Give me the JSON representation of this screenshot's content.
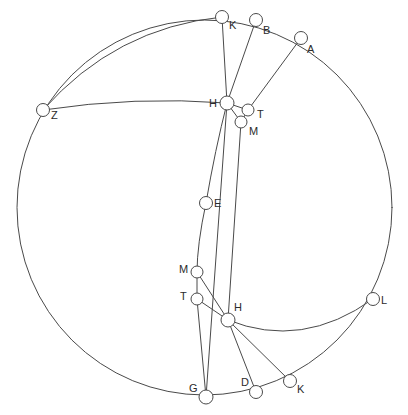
{
  "figure": {
    "background_color": "#ffffff",
    "stroke_color": "#4a4a4a",
    "label_color": "#2b2b2b",
    "width": 408,
    "height": 415
  },
  "outer_circle": {
    "name": "main-circle",
    "cx": 204.5,
    "cy": 207.5,
    "r": 187.5
  },
  "points": [
    {
      "id": "K_top",
      "label": "K",
      "x": 222,
      "y": 17,
      "r": 6.5,
      "label_dx": 7,
      "label_dy": 9
    },
    {
      "id": "B_top",
      "label": "B",
      "x": 256,
      "y": 20,
      "r": 6.5,
      "label_dx": 7,
      "label_dy": 11
    },
    {
      "id": "A_top",
      "label": "A",
      "x": 301,
      "y": 38,
      "r": 6.5,
      "label_dx": 6,
      "label_dy": 12
    },
    {
      "id": "Z_left",
      "label": "Z",
      "x": 43,
      "y": 110,
      "r": 6.5,
      "label_dx": 8,
      "label_dy": 6
    },
    {
      "id": "H_upper",
      "label": "H",
      "x": 227,
      "y": 103,
      "r": 7.0,
      "label_dx": -18,
      "label_dy": 1
    },
    {
      "id": "T_upper",
      "label": "T",
      "x": 248,
      "y": 110,
      "r": 6.0,
      "label_dx": 9,
      "label_dy": 5
    },
    {
      "id": "M_upper",
      "label": "M",
      "x": 241,
      "y": 122,
      "r": 6.0,
      "label_dx": 8,
      "label_dy": 10
    },
    {
      "id": "E_mid",
      "label": "E",
      "x": 206,
      "y": 203,
      "r": 6.5,
      "label_dx": 8,
      "label_dy": 1
    },
    {
      "id": "M_lower",
      "label": "M",
      "x": 197,
      "y": 272,
      "r": 6.0,
      "label_dx": -18,
      "label_dy": -2
    },
    {
      "id": "T_lower",
      "label": "T",
      "x": 197,
      "y": 299,
      "r": 6.0,
      "label_dx": -17,
      "label_dy": -2
    },
    {
      "id": "H_lower",
      "label": "H",
      "x": 228,
      "y": 320,
      "r": 7.0,
      "label_dx": 6,
      "label_dy": -12
    },
    {
      "id": "L_right",
      "label": "L",
      "x": 373,
      "y": 299,
      "r": 6.5,
      "label_dx": 8,
      "label_dy": 2
    },
    {
      "id": "G_bottom",
      "label": "G",
      "x": 206,
      "y": 397,
      "r": 7.0,
      "label_dx": -17,
      "label_dy": -8
    },
    {
      "id": "D_bottom",
      "label": "D",
      "x": 256,
      "y": 392,
      "r": 6.5,
      "label_dx": -15,
      "label_dy": -9
    },
    {
      "id": "K_bottom",
      "label": "K",
      "x": 290,
      "y": 381,
      "r": 6.5,
      "label_dx": 7,
      "label_dy": 9
    }
  ],
  "segments": [
    {
      "name": "segment-K-H-upper",
      "from": "K_top",
      "to": "H_upper"
    },
    {
      "name": "segment-B-H-upper",
      "from": "B_top",
      "to": "H_upper"
    },
    {
      "name": "segment-A-T-upper",
      "from": "A_top",
      "to": "T_upper"
    },
    {
      "name": "segment-H-T-upper",
      "from": "H_upper",
      "to": "T_upper"
    },
    {
      "name": "segment-H-M-upper",
      "from": "H_upper",
      "to": "M_upper"
    },
    {
      "name": "segment-T-M-upper",
      "from": "T_upper",
      "to": "M_upper"
    },
    {
      "name": "segment-M-upper-H-lower",
      "from": "M_upper",
      "to": "H_lower"
    },
    {
      "name": "segment-H-upper-G",
      "from": "H_upper",
      "to": "G_bottom"
    },
    {
      "name": "segment-M-T-lower",
      "from": "M_lower",
      "to": "T_lower"
    },
    {
      "name": "segment-T-lower-G",
      "from": "T_lower",
      "to": "G_bottom"
    },
    {
      "name": "segment-T-lower-H-lower",
      "from": "T_lower",
      "to": "H_lower"
    },
    {
      "name": "segment-H-lower-D",
      "from": "H_lower",
      "to": "D_bottom"
    },
    {
      "name": "segment-H-lower-K-bottom",
      "from": "H_lower",
      "to": "K_bottom"
    },
    {
      "name": "segment-M-lower-H-lower",
      "from": "M_lower",
      "to": "H_lower"
    }
  ],
  "arcs": [
    {
      "name": "arc-Z-to-H-upper",
      "d": "M 43 110 Q 135 96 227 103"
    },
    {
      "name": "arc-Z-to-K-top",
      "d": "M 43 110 Q 115 28 222 17"
    },
    {
      "name": "arc-H-lower-to-L",
      "d": "M 228 320 Q 302 350 373 299"
    },
    {
      "name": "arc-E-chain-upper",
      "d": "M 227 103 Q 215 150 206 203"
    },
    {
      "name": "arc-E-chain-lower",
      "d": "M 206 203 Q 197 245 197 272"
    }
  ],
  "legend": {
    "description": "Large circle with inscribed arcs and labelled vertices",
    "vertex_labels": [
      "K",
      "B",
      "A",
      "Z",
      "H",
      "T",
      "M",
      "E",
      "M",
      "T",
      "H",
      "L",
      "G",
      "D",
      "K"
    ]
  }
}
